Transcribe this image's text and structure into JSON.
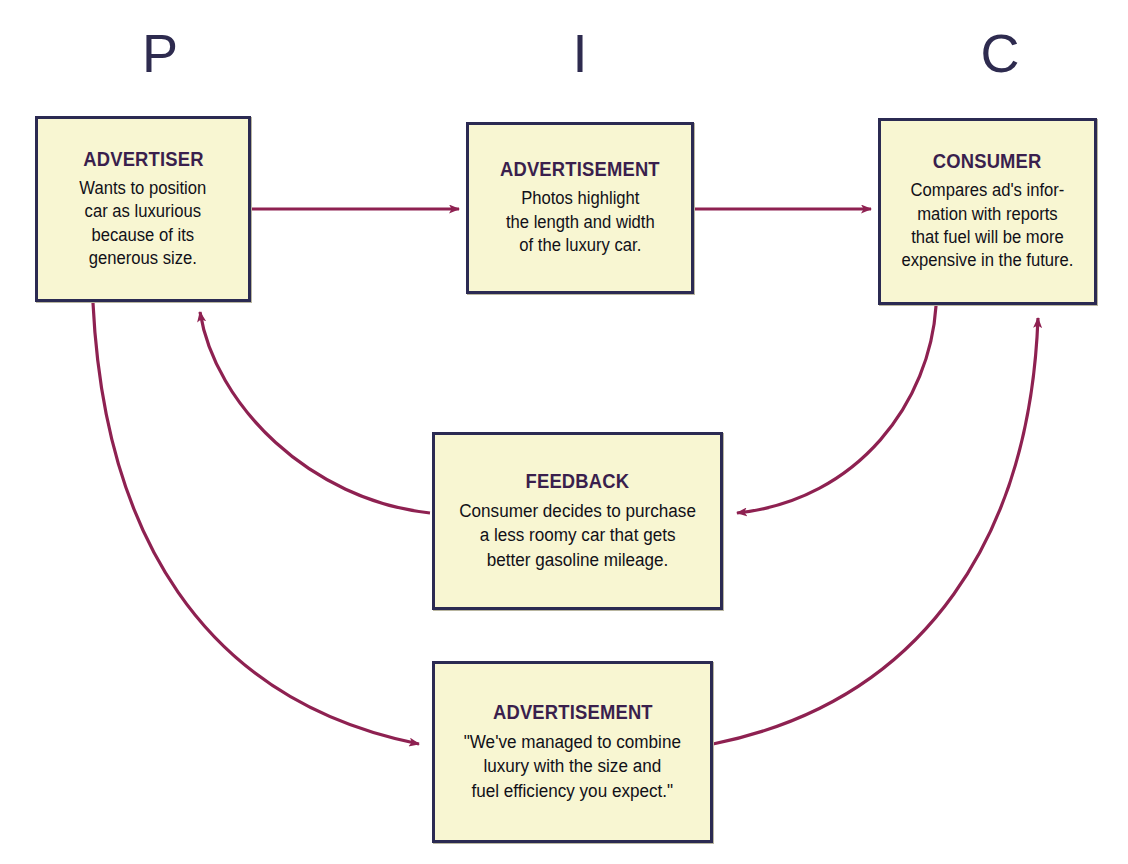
{
  "diagram": {
    "colors": {
      "box_fill": "#f8f6d2",
      "box_border": "#2b2a52",
      "title_text": "#3a1f4d",
      "body_text": "#111018",
      "arrow": "#8e2151",
      "marker_text": "#2e2b4f",
      "background": "#ffffff"
    },
    "markers": [
      {
        "id": "p",
        "label": "P"
      },
      {
        "id": "i",
        "label": "I"
      },
      {
        "id": "c",
        "label": "C"
      }
    ],
    "nodes": [
      {
        "id": "advertiser",
        "title": "ADVERTISER",
        "body": "Wants to position\ncar as luxurious\nbecause of its\ngenerous size."
      },
      {
        "id": "advertisement-top",
        "title": "ADVERTISEMENT",
        "body": "Photos highlight\nthe length and width\nof the luxury car."
      },
      {
        "id": "consumer",
        "title": "CONSUMER",
        "body": "Compares ad's infor-\nmation with reports\nthat fuel will be more\nexpensive in the future."
      },
      {
        "id": "feedback",
        "title": "FEEDBACK",
        "body": "Consumer decides to purchase\na less roomy car that gets\nbetter gasoline mileage."
      },
      {
        "id": "advertisement-bottom",
        "title": "ADVERTISEMENT",
        "body": "\"We've managed to combine\nluxury with the size and\nfuel efficiency you expect.\""
      }
    ],
    "connectors": [
      {
        "id": "advertiser-to-advertisement-top",
        "from": "advertiser",
        "to": "advertisement-top",
        "style": "straight"
      },
      {
        "id": "advertisement-top-to-consumer",
        "from": "advertisement-top",
        "to": "consumer",
        "style": "straight"
      },
      {
        "id": "consumer-to-feedback",
        "from": "consumer",
        "to": "feedback",
        "style": "curved"
      },
      {
        "id": "feedback-to-advertiser",
        "from": "feedback",
        "to": "advertiser",
        "style": "curved"
      },
      {
        "id": "advertiser-to-advertisement-bottom",
        "from": "advertiser",
        "to": "advertisement-bottom",
        "style": "curved"
      },
      {
        "id": "advertisement-bottom-to-consumer",
        "from": "advertisement-bottom",
        "to": "consumer",
        "style": "curved"
      }
    ]
  }
}
